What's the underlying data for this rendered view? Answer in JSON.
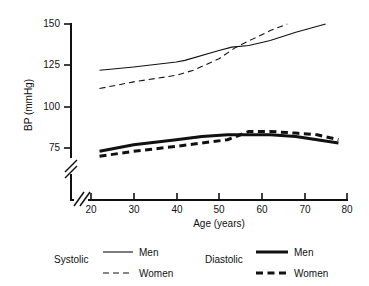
{
  "chart_data": {
    "type": "line",
    "title": "",
    "xlabel": "Age (years)",
    "ylabel": "BP (mmHg)",
    "xlim": [
      20,
      80
    ],
    "ylim": [
      70,
      150
    ],
    "xticks": [
      20,
      30,
      40,
      50,
      60,
      70,
      80
    ],
    "yticks": [
      75,
      100,
      125,
      150
    ],
    "xtick_labels": [
      "20",
      "30",
      "40",
      "50",
      "60",
      "70",
      "80"
    ],
    "ytick_labels": [
      "75",
      "100",
      "125",
      "150"
    ],
    "grid": false,
    "axis_breaks": {
      "y_axis_break": true,
      "x_axis_break": true,
      "note": "double-slash break marks near origin on both axes"
    },
    "legend": {
      "position": "below-plot",
      "groups": [
        {
          "name": "Systolic",
          "entries": [
            {
              "label": "Men",
              "style": "solid",
              "width": "thin"
            },
            {
              "label": "Women",
              "style": "dashed",
              "width": "thin"
            }
          ]
        },
        {
          "name": "Diastolic",
          "entries": [
            {
              "label": "Men",
              "style": "solid",
              "width": "thick"
            },
            {
              "label": "Women",
              "style": "dashed",
              "width": "thick"
            }
          ]
        }
      ]
    },
    "series": [
      {
        "name": "Systolic Men",
        "style": "solid",
        "width": "thin",
        "x": [
          22,
          30,
          40,
          42,
          50,
          53,
          57,
          62,
          68,
          75
        ],
        "values": [
          122,
          124,
          127,
          128,
          134,
          136,
          137,
          140,
          145,
          150
        ]
      },
      {
        "name": "Systolic Women",
        "style": "dashed",
        "width": "thin",
        "x": [
          22,
          30,
          40,
          44,
          50,
          54,
          58,
          62,
          66
        ],
        "values": [
          111,
          115,
          119,
          122,
          129,
          136,
          141,
          146,
          150
        ]
      },
      {
        "name": "Diastolic Men",
        "style": "solid",
        "width": "thick",
        "x": [
          22,
          30,
          40,
          46,
          52,
          57,
          62,
          68,
          73,
          78
        ],
        "values": [
          73,
          77,
          80,
          82,
          83,
          83,
          83,
          82,
          80,
          78
        ]
      },
      {
        "name": "Diastolic Women",
        "style": "dashed",
        "width": "thick",
        "x": [
          22,
          30,
          40,
          46,
          52,
          57,
          62,
          68,
          73,
          78
        ],
        "values": [
          70,
          73,
          76,
          78,
          80,
          85,
          85,
          84,
          83,
          80
        ]
      }
    ]
  }
}
